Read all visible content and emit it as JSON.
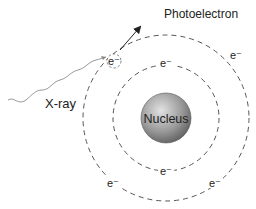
{
  "diagram": {
    "title_label": "Photoelectron",
    "incident_label": "X-ray",
    "nucleus_label": "Nucleus",
    "electron_label": "e⁻",
    "electrons": {
      "ejected": "e⁻",
      "outer_top_right": "e⁻",
      "outer_bottom_left": "e⁻",
      "outer_bottom_right": "e⁻",
      "inner_top": "e⁻",
      "inner_bottom": "e⁻"
    },
    "colors": {
      "orbit": "#555555",
      "nucleus_light": "#d8d8d8",
      "nucleus_dark": "#6a6a6a",
      "wave": "#999999",
      "arrow": "#222222"
    }
  }
}
